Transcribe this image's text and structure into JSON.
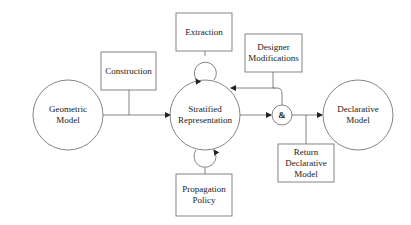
{
  "diagram": {
    "nodes": {
      "geometric_model": {
        "label_line1": "Geometric",
        "label_line2": "Model",
        "shape": "circle"
      },
      "construction": {
        "label": "Construction",
        "shape": "box"
      },
      "extraction": {
        "label": "Extraction",
        "shape": "box"
      },
      "stratified_representation": {
        "label_line1": "Stratified",
        "label_line2": "Representation",
        "shape": "circle"
      },
      "propagation_policy": {
        "label_line1": "Propagation",
        "label_line2": "Policy",
        "shape": "box"
      },
      "designer_modifications": {
        "label_line1": "Designer",
        "label_line2": "Modifications",
        "shape": "box"
      },
      "and_junction": {
        "label": "&",
        "shape": "circle"
      },
      "declarative_model": {
        "label_line1": "Declarative",
        "label_line2": "Model",
        "shape": "circle"
      },
      "return_declarative_model": {
        "label_line1": "Return",
        "label_line2": "Declarative",
        "label_line3": "Model",
        "shape": "box"
      }
    },
    "edges": [
      {
        "from": "geometric_model",
        "to": "stratified_representation"
      },
      {
        "from": "construction",
        "to": "geometric_model->stratified_representation"
      },
      {
        "from": "extraction",
        "to": "stratified_representation",
        "type": "loop"
      },
      {
        "from": "propagation_policy",
        "to": "stratified_representation",
        "type": "loop"
      },
      {
        "from": "stratified_representation",
        "to": "and_junction"
      },
      {
        "from": "designer_modifications",
        "to": "stratified_representation"
      },
      {
        "from": "designer_modifications",
        "to": "and_junction"
      },
      {
        "from": "and_junction",
        "to": "declarative_model"
      },
      {
        "from": "and_junction->declarative_model",
        "to": "return_declarative_model"
      }
    ],
    "colors": {
      "stroke": "#555555",
      "text": "#222222",
      "background": "#ffffff"
    }
  }
}
